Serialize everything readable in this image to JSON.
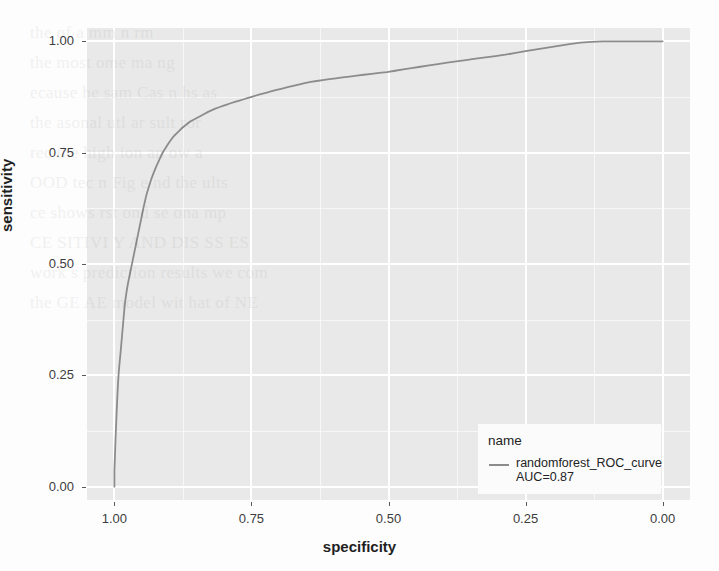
{
  "figure": {
    "type": "roc-curve-plot",
    "style": "ggplot2-theme-gray"
  },
  "axes": {
    "x": {
      "title": "specificity",
      "ticks": [
        "1.00",
        "0.75",
        "0.50",
        "0.25",
        "0.00"
      ],
      "tick_values": [
        1.0,
        0.75,
        0.5,
        0.25,
        0.0
      ],
      "reversed": true,
      "range": [
        1.05,
        -0.05
      ]
    },
    "y": {
      "title": "sensitivity",
      "ticks": [
        "0.00",
        "0.25",
        "0.50",
        "0.75",
        "1.00"
      ],
      "tick_values": [
        0.0,
        0.25,
        0.5,
        0.75,
        1.0
      ],
      "range": [
        -0.03,
        1.03
      ]
    }
  },
  "legend": {
    "title": "name",
    "entries": [
      {
        "label_line1": "randomforest_ROC_curve",
        "label_line2": "AUC=0.87",
        "color": "#8c8c8c",
        "key_icon": "line-key-icon"
      }
    ]
  },
  "colors": {
    "panel_background": "#e9e9e9",
    "gridline": "#ffffff",
    "curve": "#8c8c8c",
    "axis_text": "#3d3d3d",
    "title_text": "#1f1f1f",
    "legend_background": "#fbfbfb"
  },
  "chart_data": {
    "type": "line",
    "title": "",
    "xlabel": "specificity",
    "ylabel": "sensitivity",
    "xlim": [
      1.05,
      -0.05
    ],
    "ylim": [
      -0.03,
      1.03
    ],
    "x_reversed": true,
    "grid": true,
    "legend_position": "inside-bottom-right",
    "annotations": [
      "AUC=0.87"
    ],
    "series": [
      {
        "name": "randomforest_ROC_curve",
        "auc": 0.87,
        "color": "#8c8c8c",
        "specificity": [
          1.0,
          1.0,
          0.999,
          0.998,
          0.997,
          0.996,
          0.995,
          0.994,
          0.993,
          0.992,
          0.991,
          0.99,
          0.989,
          0.988,
          0.987,
          0.986,
          0.985,
          0.984,
          0.983,
          0.982,
          0.981,
          0.979,
          0.977,
          0.975,
          0.973,
          0.971,
          0.969,
          0.967,
          0.965,
          0.963,
          0.961,
          0.959,
          0.957,
          0.955,
          0.953,
          0.951,
          0.949,
          0.947,
          0.945,
          0.943,
          0.941,
          0.938,
          0.935,
          0.932,
          0.929,
          0.926,
          0.923,
          0.92,
          0.917,
          0.914,
          0.911,
          0.907,
          0.903,
          0.899,
          0.895,
          0.891,
          0.886,
          0.881,
          0.876,
          0.871,
          0.866,
          0.86,
          0.854,
          0.848,
          0.842,
          0.836,
          0.83,
          0.823,
          0.816,
          0.809,
          0.802,
          0.795,
          0.788,
          0.78,
          0.772,
          0.764,
          0.756,
          0.748,
          0.74,
          0.731,
          0.722,
          0.713,
          0.704,
          0.694,
          0.684,
          0.674,
          0.664,
          0.653,
          0.642,
          0.631,
          0.62,
          0.608,
          0.596,
          0.584,
          0.571,
          0.558,
          0.545,
          0.531,
          0.517,
          0.503,
          0.488,
          0.473,
          0.458,
          0.442,
          0.426,
          0.41,
          0.393,
          0.376,
          0.359,
          0.341,
          0.323,
          0.305,
          0.287,
          0.268,
          0.25,
          0.23,
          0.21,
          0.19,
          0.17,
          0.15,
          0.13,
          0.11,
          0.09,
          0.07,
          0.05,
          0.03,
          0.015,
          0.0
        ],
        "sensitivity": [
          0.0,
          0.035,
          0.07,
          0.105,
          0.135,
          0.165,
          0.192,
          0.218,
          0.24,
          0.258,
          0.272,
          0.285,
          0.298,
          0.312,
          0.326,
          0.34,
          0.354,
          0.368,
          0.382,
          0.396,
          0.41,
          0.428,
          0.444,
          0.458,
          0.47,
          0.482,
          0.494,
          0.506,
          0.518,
          0.53,
          0.542,
          0.554,
          0.566,
          0.578,
          0.59,
          0.602,
          0.614,
          0.626,
          0.637,
          0.648,
          0.658,
          0.67,
          0.682,
          0.693,
          0.703,
          0.712,
          0.721,
          0.729,
          0.737,
          0.745,
          0.752,
          0.76,
          0.768,
          0.775,
          0.782,
          0.788,
          0.794,
          0.8,
          0.806,
          0.811,
          0.816,
          0.821,
          0.825,
          0.829,
          0.833,
          0.837,
          0.841,
          0.845,
          0.849,
          0.852,
          0.855,
          0.858,
          0.861,
          0.864,
          0.867,
          0.87,
          0.873,
          0.876,
          0.879,
          0.882,
          0.885,
          0.888,
          0.891,
          0.894,
          0.897,
          0.9,
          0.903,
          0.906,
          0.909,
          0.911,
          0.913,
          0.915,
          0.917,
          0.919,
          0.921,
          0.923,
          0.925,
          0.927,
          0.929,
          0.931,
          0.934,
          0.937,
          0.94,
          0.943,
          0.946,
          0.949,
          0.952,
          0.955,
          0.958,
          0.961,
          0.964,
          0.967,
          0.97,
          0.974,
          0.978,
          0.982,
          0.986,
          0.99,
          0.994,
          0.997,
          0.999,
          1.0,
          1.0,
          1.0,
          1.0,
          1.0,
          1.0,
          1.0
        ]
      }
    ]
  },
  "ghost_text": [
    "the   of   a   mm   n   rm",
    "the   most   ome   ma   ng",
    "ecause   he   sam   Cas   n   hs   as",
    "the   asonal   utl   ar   sult   ror",
    "rec   the   high   ion   an   ow   a",
    "OOD   tec   n   Fig   e   nd   the   ults",
    "ce   shows   rst   ond   se   ona   mp",
    "CE   SITIVI   Y   AND   DIS   SS   ES",
    "work   s   prediction   results   we   com",
    "the   GE   AE   model   wit   hat   of   NE"
  ]
}
